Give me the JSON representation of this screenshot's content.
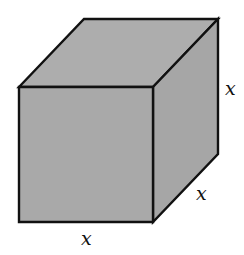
{
  "figure": {
    "type": "cube",
    "fill_color": "#a9a9a9",
    "stroke_color": "#111111",
    "vertices": {
      "front_top_left": [
        19,
        87
      ],
      "front_top_right": [
        153,
        87
      ],
      "front_bottom_right": [
        153,
        222
      ],
      "front_bottom_left": [
        19,
        222
      ],
      "back_top_left": [
        84,
        19
      ],
      "back_top_right": [
        218,
        19
      ],
      "back_bottom_right": [
        218,
        154
      ]
    },
    "labels": {
      "height": "x",
      "depth": "x",
      "width": "x"
    }
  }
}
